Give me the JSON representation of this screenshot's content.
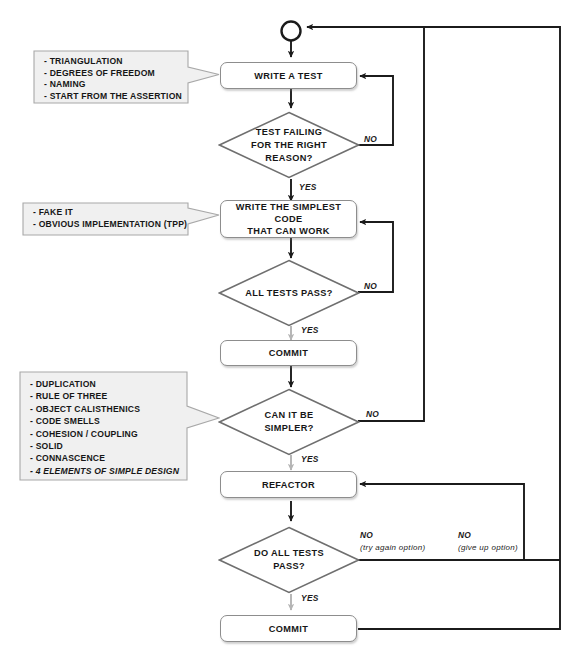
{
  "diagram": {
    "start_node": "start-circle",
    "colors": {
      "node_border": "#8d8d8d",
      "node_fill": "#ffffff",
      "callout_fill": "#f0f0f0",
      "callout_border": "#a8a8a8",
      "flow_black": "#1b1b1b",
      "flow_gray": "#b4b4b4",
      "text": "#161616"
    }
  },
  "nodes": {
    "write_a_test": "WRITE A TEST",
    "write_simplest_code_line1": "WRITE THE SIMPLEST CODE",
    "write_simplest_code_line2": "THAT CAN WORK",
    "commit_1": "COMMIT",
    "refactor": "REFACTOR",
    "commit_2": "COMMIT"
  },
  "decisions": {
    "test_failing": {
      "line1": "TEST FAILING",
      "line2": "FOR THE RIGHT",
      "line3": "REASON?"
    },
    "all_tests_pass": {
      "line1": "ALL TESTS PASS?"
    },
    "can_it_be_simpler": {
      "line1": "CAN IT BE",
      "line2": "SIMPLER?"
    },
    "do_all_tests_pass": {
      "line1": "DO ALL TESTS",
      "line2": "PASS?"
    }
  },
  "edge_labels": {
    "test_failing_no": "NO",
    "test_failing_yes": "YES",
    "all_tests_pass_no": "NO",
    "all_tests_pass_yes": "YES",
    "can_it_be_simpler_no": "NO",
    "can_it_be_simpler_yes": "YES",
    "do_all_tests_pass_no_try": "NO",
    "do_all_tests_pass_no_try_sub": "(try again option)",
    "do_all_tests_pass_no_give": "NO",
    "do_all_tests_pass_no_give_sub": "(give up option)",
    "do_all_tests_pass_yes": "YES"
  },
  "callouts": {
    "write_a_test_tips": {
      "items": [
        {
          "text": "- TRIANGULATION",
          "emphasis": false
        },
        {
          "text": "- DEGREES OF FREEDOM",
          "emphasis": false
        },
        {
          "text": "- NAMING",
          "emphasis": false
        },
        {
          "text": "- START FROM THE ASSERTION",
          "emphasis": false
        }
      ]
    },
    "simplest_code_tips": {
      "items": [
        {
          "text": "- FAKE IT",
          "emphasis": false
        },
        {
          "text": "- OBVIOUS IMPLEMENTATION (TPP)",
          "emphasis": false
        }
      ]
    },
    "simpler_tips": {
      "items": [
        {
          "text": "- DUPLICATION",
          "emphasis": false
        },
        {
          "text": "- RULE OF THREE",
          "emphasis": false
        },
        {
          "text": "- OBJECT CALISTHENICS",
          "emphasis": false
        },
        {
          "text": "- CODE SMELLS",
          "emphasis": false
        },
        {
          "text": "- COHESION / COUPLING",
          "emphasis": false
        },
        {
          "text": "- SOLID",
          "emphasis": false
        },
        {
          "text": "- CONNASCENCE",
          "emphasis": false
        },
        {
          "text": "- 4 ELEMENTS OF SIMPLE DESIGN",
          "emphasis": true
        }
      ]
    }
  }
}
